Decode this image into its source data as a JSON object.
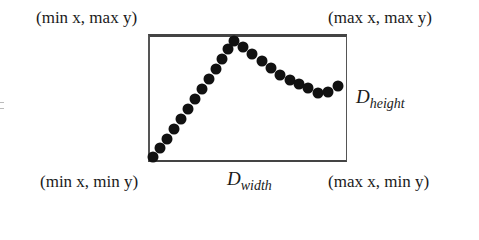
{
  "diagram": {
    "corners": {
      "top_left": "(min x, max y)",
      "top_right": "(max x, max y)",
      "bottom_left": "(min x, min y)",
      "bottom_right": "(max x, min y)"
    },
    "dimensions": {
      "width": {
        "base": "D",
        "sub": "width"
      },
      "height": {
        "base": "D",
        "sub": "height"
      }
    },
    "colors": {
      "dots": "#111111",
      "box": "#444444",
      "text": "#1a1a1a"
    },
    "points": [
      [
        153,
        157
      ],
      [
        160,
        148
      ],
      [
        167,
        139
      ],
      [
        174,
        129
      ],
      [
        181,
        119
      ],
      [
        188,
        109
      ],
      [
        195,
        99
      ],
      [
        202,
        89
      ],
      [
        209,
        79
      ],
      [
        216,
        69
      ],
      [
        222,
        59
      ],
      [
        228,
        49
      ],
      [
        234,
        41
      ],
      [
        243,
        47
      ],
      [
        252,
        54
      ],
      [
        262,
        61
      ],
      [
        271,
        68
      ],
      [
        280,
        75
      ],
      [
        290,
        80
      ],
      [
        299,
        84
      ],
      [
        308,
        88
      ],
      [
        318,
        93
      ],
      [
        328,
        97
      ],
      [
        338,
        101
      ],
      [
        342,
        86
      ]
    ]
  }
}
